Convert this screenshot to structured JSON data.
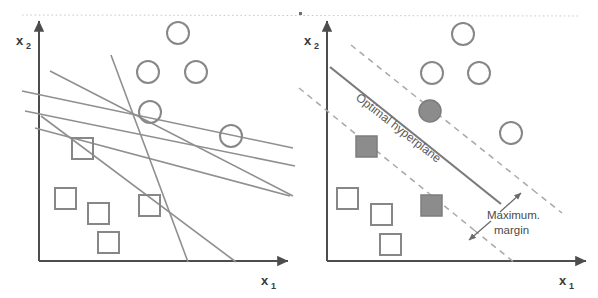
{
  "figure": {
    "colors": {
      "axis": "#4d4d4d",
      "line": "#8f8f8f",
      "dashed": "#a8a8a8",
      "hyperplane": "#7a7a7a",
      "marker_stroke": "#878787",
      "marker_fill": "#8c8c8c",
      "background": "#ffffff",
      "top_rule": "#c9c9c9",
      "text": "#3a3a3a"
    },
    "top_rule": {
      "visible": true,
      "y": 15
    }
  },
  "panels": [
    {
      "id": "left",
      "name": "arbitrary-hyperplanes-panel",
      "axes": {
        "x_label": "x",
        "x_sublabel": "1",
        "y_label": "x",
        "y_sublabel": "2",
        "origin": [
          39,
          261
        ],
        "x_end": [
          290,
          261
        ],
        "y_end": [
          39,
          19
        ]
      },
      "circles": [
        {
          "cx": 178,
          "cy": 33,
          "r": 11
        },
        {
          "cx": 148,
          "cy": 72,
          "r": 11
        },
        {
          "cx": 196,
          "cy": 72,
          "r": 11
        },
        {
          "cx": 150,
          "cy": 112,
          "r": 11
        },
        {
          "cx": 231,
          "cy": 136,
          "r": 11
        }
      ],
      "squares": [
        {
          "x": 72,
          "y": 138,
          "size": 21
        },
        {
          "x": 55,
          "y": 188,
          "size": 21
        },
        {
          "x": 88,
          "y": 203,
          "size": 21
        },
        {
          "x": 139,
          "y": 195,
          "size": 21
        },
        {
          "x": 98,
          "y": 232,
          "size": 21
        }
      ],
      "separating_lines": [
        {
          "x1": 22,
          "y1": 91,
          "x2": 293,
          "y2": 148,
          "name": "line-a"
        },
        {
          "x1": 25,
          "y1": 111,
          "x2": 295,
          "y2": 166,
          "name": "line-b"
        },
        {
          "x1": 50,
          "y1": 71,
          "x2": 293,
          "y2": 196,
          "name": "line-c"
        },
        {
          "x1": 35,
          "y1": 128,
          "x2": 290,
          "y2": 196,
          "name": "line-d"
        },
        {
          "x1": 111,
          "y1": 55,
          "x2": 188,
          "y2": 262,
          "name": "line-e"
        },
        {
          "x1": 41,
          "y1": 116,
          "x2": 236,
          "y2": 262,
          "name": "line-f"
        }
      ]
    },
    {
      "id": "right",
      "name": "optimal-hyperplane-panel",
      "axes": {
        "x_label": "x",
        "x_sublabel": "1",
        "y_label": "x",
        "y_sublabel": "2",
        "origin": [
          327,
          261
        ],
        "x_end": [
          588,
          261
        ],
        "y_end": [
          327,
          19
        ]
      },
      "circles": [
        {
          "cx": 463,
          "cy": 34,
          "r": 11
        },
        {
          "cx": 432,
          "cy": 73,
          "r": 11
        },
        {
          "cx": 479,
          "cy": 73,
          "r": 11
        },
        {
          "cx": 511,
          "cy": 133,
          "r": 11
        }
      ],
      "support_circles": [
        {
          "cx": 430,
          "cy": 111,
          "r": 11
        }
      ],
      "squares": [
        {
          "x": 337,
          "y": 188,
          "size": 21
        },
        {
          "x": 371,
          "y": 204,
          "size": 21
        },
        {
          "x": 380,
          "y": 234,
          "size": 21
        }
      ],
      "support_squares": [
        {
          "x": 356,
          "y": 136,
          "size": 21
        },
        {
          "x": 421,
          "y": 195,
          "size": 21
        }
      ],
      "hyperplane": {
        "x1": 330,
        "y1": 67,
        "x2": 500,
        "y2": 203
      },
      "margin_lines": [
        {
          "x1": 351,
          "y1": 45,
          "x2": 533,
          "y2": 190,
          "name": "upper-margin-line"
        },
        {
          "x1": 299,
          "y1": 88,
          "x2": 474,
          "y2": 230,
          "name": "lower-margin-line"
        }
      ],
      "margin_extensions": [
        {
          "x1": 533,
          "y1": 190,
          "x2": 560,
          "y2": 212,
          "name": "upper-margin-extension"
        },
        {
          "x1": 474,
          "y1": 230,
          "x2": 513,
          "y2": 262,
          "name": "lower-margin-extension"
        }
      ],
      "annotations": [
        {
          "name": "hyperplane-label",
          "text": "Optimal hyperplane",
          "x": 355,
          "y": 102,
          "rotation": 38
        },
        {
          "name": "margin-label-line1",
          "text": "Maximum.",
          "x": 492,
          "y": 217
        },
        {
          "name": "margin-label-line2",
          "text": "margin",
          "x": 497,
          "y": 231
        }
      ],
      "arrows": [
        {
          "name": "margin-arrow-up",
          "x1": 499,
          "y1": 211,
          "x2": 520,
          "y2": 193
        },
        {
          "name": "margin-arrow-down",
          "x1": 490,
          "y1": 221,
          "x2": 469,
          "y2": 239
        }
      ]
    }
  ]
}
